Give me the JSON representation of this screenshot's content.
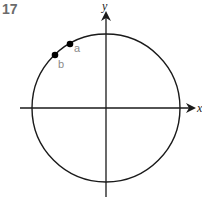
{
  "figure": {
    "number": "17"
  },
  "axes": {
    "x_label": "x",
    "y_label": "y"
  },
  "circle": {
    "center": [
      106,
      108
    ],
    "radius": 74
  },
  "points": [
    {
      "label": "a",
      "cx": 70,
      "cy": 44
    },
    {
      "label": "b",
      "cx": 55,
      "cy": 55
    }
  ],
  "colors": {
    "stroke": "#1a1a1a",
    "point_label": "#8a8a8a",
    "figure_number": "#6b6b6b"
  }
}
